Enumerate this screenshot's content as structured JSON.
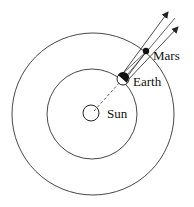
{
  "diagram": {
    "labels": {
      "sun": "Sun",
      "earth": "Earth",
      "mars": "Mars"
    },
    "colors": {
      "stroke": "#2a2a2a",
      "background": "#ffffff"
    },
    "orbits": [
      {
        "name": "earth-orbit",
        "cx": 92,
        "cy": 114,
        "r": 45
      },
      {
        "name": "mars-orbit",
        "cx": 93,
        "cy": 114,
        "r": 81
      }
    ],
    "bodies": {
      "sun": {
        "cx": 91,
        "cy": 113,
        "r": 8
      },
      "earth": {
        "cx": 123,
        "cy": 79,
        "r": 6
      },
      "mars": {
        "cx": 146,
        "cy": 51,
        "r": 3
      }
    }
  }
}
